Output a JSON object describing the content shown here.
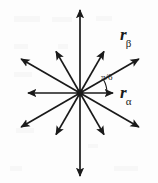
{
  "figure": {
    "background_color": "#fdfdfd",
    "stroke_color": "#1a1a1a",
    "width": 158,
    "height": 183
  },
  "chart_data": {
    "type": "scatter",
    "title": "",
    "xlabel": "",
    "ylabel": "",
    "origin": {
      "x": 80,
      "y": 93
    },
    "spoke_count": 12,
    "angle_step_deg": 30,
    "angle_step_label": "π/6",
    "radius_px": 83,
    "grid": false,
    "legend": false,
    "spokes": [
      {
        "index": 0,
        "angle_deg": 0,
        "label": "rα",
        "labeled": true,
        "length_px": 33
      },
      {
        "index": 1,
        "angle_deg": 30,
        "label": "rβ",
        "labeled": true,
        "length_px": 68
      },
      {
        "index": 2,
        "angle_deg": 60,
        "label": "",
        "labeled": false,
        "length_px": 48
      },
      {
        "index": 3,
        "angle_deg": 90,
        "label": "",
        "labeled": false,
        "length_px": 83
      },
      {
        "index": 4,
        "angle_deg": 120,
        "label": "",
        "labeled": false,
        "length_px": 48
      },
      {
        "index": 5,
        "angle_deg": 150,
        "label": "",
        "labeled": false,
        "length_px": 68
      },
      {
        "index": 6,
        "angle_deg": 180,
        "label": "",
        "labeled": false,
        "length_px": 52
      },
      {
        "index": 7,
        "angle_deg": 210,
        "label": "",
        "labeled": false,
        "length_px": 68
      },
      {
        "index": 8,
        "angle_deg": 240,
        "label": "",
        "labeled": false,
        "length_px": 48
      },
      {
        "index": 9,
        "angle_deg": 270,
        "label": "",
        "labeled": false,
        "length_px": 83
      },
      {
        "index": 10,
        "angle_deg": 300,
        "label": "",
        "labeled": false,
        "length_px": 48
      },
      {
        "index": 11,
        "angle_deg": 330,
        "label": "",
        "labeled": false,
        "length_px": 68
      }
    ]
  },
  "labels": {
    "alpha": {
      "base": "r",
      "sub": "α"
    },
    "beta": {
      "base": "r",
      "sub": "β"
    },
    "angle": "π/6"
  }
}
